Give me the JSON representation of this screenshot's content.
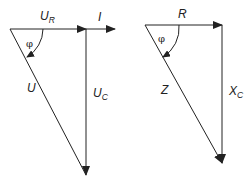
{
  "diagram": {
    "colors": {
      "line": "#222222",
      "background": "#ffffff"
    },
    "voltage_triangle": {
      "labels": {
        "ur_main": "U",
        "ur_sub": "R",
        "i": "I",
        "u": "U",
        "uc_main": "U",
        "uc_sub": "C",
        "angle": "φ"
      }
    },
    "impedance_triangle": {
      "labels": {
        "r": "R",
        "z": "Z",
        "xc_main": "X",
        "xc_sub": "C",
        "angle": "φ"
      }
    }
  }
}
